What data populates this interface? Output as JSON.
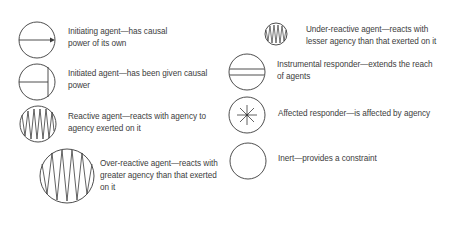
{
  "legend": {
    "items": [
      {
        "id": "initiating-agent",
        "icon": "circle-arrow-icon",
        "line1": "Initiating agent—has causal",
        "line2": "power of its own"
      },
      {
        "id": "initiated-agent",
        "icon": "circle-t-icon",
        "line1": "Initiated agent—has been given causal",
        "line2": "power"
      },
      {
        "id": "reactive-agent",
        "icon": "circle-zigzag-icon",
        "line1": "Reactive agent—reacts with agency to",
        "line2": "agency exerted on it"
      },
      {
        "id": "over-reactive-agent",
        "icon": "large-circle-zigzag-icon",
        "line1": "Over-reactive agent—reacts with",
        "line2": "greater agency than that exerted",
        "line3": "on it"
      },
      {
        "id": "under-reactive-agent",
        "icon": "small-circle-zigzag-icon",
        "line1": "Under-reactive agent—reacts with",
        "line2": "lesser agency than that exerted on it"
      },
      {
        "id": "instrumental-responder",
        "icon": "circle-double-line-icon",
        "line1": "Instrumental responder—extends the reach",
        "line2": "of agents"
      },
      {
        "id": "affected-responder",
        "icon": "circle-asterisk-icon",
        "line1": "Affected responder—is affected by agency"
      },
      {
        "id": "inert",
        "icon": "empty-circle-icon",
        "line1": "Inert—provides a constraint"
      }
    ]
  },
  "colors": {
    "stroke": "#3a3a3a",
    "text": "#3c3c3c",
    "background": "#ffffff"
  }
}
